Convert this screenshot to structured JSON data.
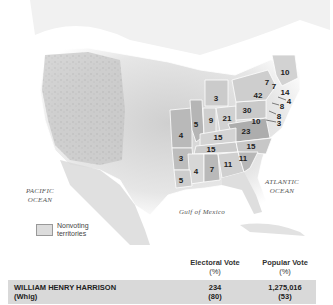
{
  "map": {
    "ocean_labels": {
      "pacific": [
        "PACIFIC",
        "OCEAN"
      ],
      "atlantic": [
        "ATLANTIC",
        "OCEAN"
      ],
      "gulf": "Gulf of Mexico"
    },
    "legend": {
      "label_line1": "Nonvoting",
      "label_line2": "territories",
      "swatch_color": "#dcdcdc"
    },
    "state_electoral_votes": [
      {
        "state": "ME",
        "votes": "10",
        "x": 285,
        "y": 72
      },
      {
        "state": "VT",
        "votes": "7",
        "x": 267,
        "y": 82
      },
      {
        "state": "NH",
        "votes": "7",
        "x": 274,
        "y": 86
      },
      {
        "state": "MA",
        "votes": "14",
        "x": 285,
        "y": 92
      },
      {
        "state": "NY",
        "votes": "42",
        "x": 258,
        "y": 95
      },
      {
        "state": "RI",
        "votes": "4",
        "x": 289,
        "y": 101
      },
      {
        "state": "CT",
        "votes": "8",
        "x": 282,
        "y": 106
      },
      {
        "state": "NJ",
        "votes": "8",
        "x": 279,
        "y": 116
      },
      {
        "state": "PA",
        "votes": "30",
        "x": 247,
        "y": 110
      },
      {
        "state": "MD",
        "votes": "10",
        "x": 256,
        "y": 121
      },
      {
        "state": "DE",
        "votes": "3",
        "x": 279,
        "y": 123
      },
      {
        "state": "MI",
        "votes": "3",
        "x": 216,
        "y": 98
      },
      {
        "state": "IL",
        "votes": "5",
        "x": 196,
        "y": 124
      },
      {
        "state": "IN",
        "votes": "9",
        "x": 211,
        "y": 120
      },
      {
        "state": "OH",
        "votes": "21",
        "x": 227,
        "y": 118
      },
      {
        "state": "VA",
        "votes": "23",
        "x": 246,
        "y": 131
      },
      {
        "state": "MO",
        "votes": "4",
        "x": 181,
        "y": 135
      },
      {
        "state": "KY",
        "votes": "15",
        "x": 218,
        "y": 137
      },
      {
        "state": "NC",
        "votes": "15",
        "x": 251,
        "y": 146
      },
      {
        "state": "TN",
        "votes": "15",
        "x": 211,
        "y": 149
      },
      {
        "state": "AR",
        "votes": "3",
        "x": 181,
        "y": 158
      },
      {
        "state": "SC",
        "votes": "11",
        "x": 243,
        "y": 158
      },
      {
        "state": "GA",
        "votes": "11",
        "x": 228,
        "y": 164
      },
      {
        "state": "AL",
        "votes": "7",
        "x": 212,
        "y": 169
      },
      {
        "state": "MS",
        "votes": "4",
        "x": 196,
        "y": 171
      },
      {
        "state": "LA",
        "votes": "5",
        "x": 181,
        "y": 180
      }
    ]
  },
  "table": {
    "headers": {
      "electoral": "Electoral Vote",
      "electoral_pct": "(%)",
      "popular": "Popular Vote",
      "popular_pct": "(%)"
    },
    "rows": [
      {
        "candidate": "WILLIAM HENRY HARRISON",
        "party": "(Whig)",
        "electoral_vote": "234",
        "electoral_pct": "(80)",
        "popular_vote": "1,275,016",
        "popular_pct": "(53)"
      }
    ],
    "row_background": "#d9d9d9"
  }
}
